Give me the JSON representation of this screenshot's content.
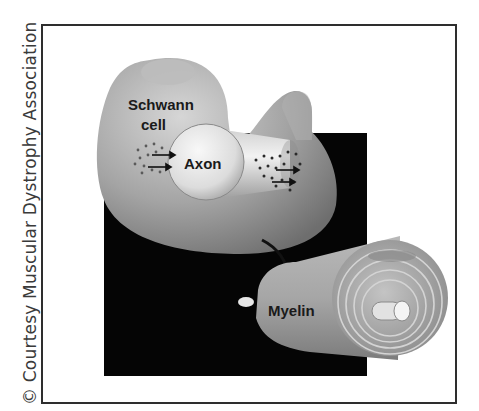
{
  "credit": "© Courtesy Muscular Dystrophy Association",
  "diagram": {
    "labels": {
      "schwann_line1": "Schwann",
      "schwann_line2": "cell",
      "axon": "Axon",
      "myelin": "Myelin"
    },
    "colors": {
      "background": "#ffffff",
      "frame": "#2e2e2e",
      "black_square": "#050505",
      "cell_gray": "#9a9a9a",
      "axon_light": "#e6e6e6",
      "text": "#1a1a1a"
    }
  }
}
